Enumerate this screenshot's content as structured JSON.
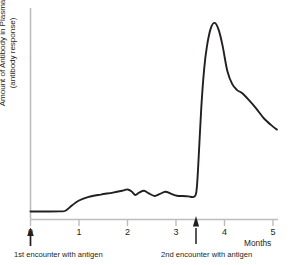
{
  "chart_data": {
    "type": "line",
    "title": "",
    "subtitle": "",
    "xlabel": "Months",
    "ylabel_line1": "Amount of Antibody in Plasma",
    "ylabel_line2": "(antibody response)",
    "xlim": [
      0,
      5
    ],
    "ylim": [
      0,
      100
    ],
    "grid": false,
    "legend": "none",
    "x_ticks": [
      "0",
      "1",
      "2",
      "3",
      "4",
      "5"
    ],
    "x_tick_values": [
      0,
      1,
      2,
      3,
      4,
      5
    ],
    "y_ticks": [],
    "series": [
      {
        "name": "antibody response",
        "color": "#231f20",
        "x": [
          0.0,
          0.3,
          0.6,
          0.72,
          0.85,
          1.0,
          1.2,
          1.45,
          1.7,
          1.9,
          2.0,
          2.08,
          2.16,
          2.24,
          2.34,
          2.44,
          2.56,
          2.66,
          2.78,
          2.9,
          3.02,
          3.14,
          3.26,
          3.36,
          3.42,
          3.46,
          3.52,
          3.58,
          3.64,
          3.72,
          3.8,
          3.88,
          3.96,
          4.06,
          4.16,
          4.26,
          4.36,
          4.5,
          4.66,
          4.82,
          5.0,
          5.08
        ],
        "y": [
          2.0,
          2.0,
          2.1,
          2.4,
          5.0,
          7.6,
          9.4,
          10.6,
          11.6,
          12.6,
          13.2,
          12.3,
          10.4,
          11.6,
          12.5,
          11.2,
          9.9,
          10.8,
          12.0,
          11.0,
          10.0,
          9.9,
          9.7,
          9.4,
          12.0,
          26.0,
          54.0,
          74.0,
          86.0,
          95.0,
          97.5,
          94.0,
          86.0,
          73.0,
          66.5,
          63.5,
          62.0,
          58.5,
          54.0,
          49.0,
          45.0,
          43.5
        ]
      }
    ],
    "annotations": [
      {
        "id": "first-encounter",
        "label": "1st encounter with antigen",
        "x": 0.0,
        "marker": "up-arrow"
      },
      {
        "id": "second-encounter",
        "label": "2nd encounter with antigen",
        "x": 3.42,
        "marker": "up-arrow"
      }
    ],
    "colors": {
      "curve": "#231f20",
      "axis": "#b9b9b9",
      "text": "#231f20",
      "background": "#ffffff"
    }
  }
}
